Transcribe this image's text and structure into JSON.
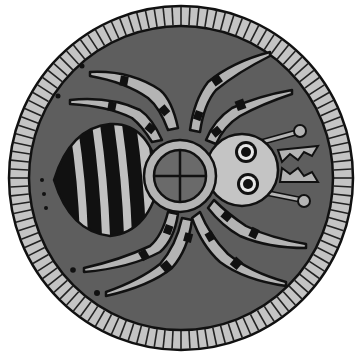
{
  "image": {
    "subject": "spider badge illustration",
    "colors": {
      "background": "#ffffff",
      "badge_fill": "#5e5e5e",
      "rim_light": "#c4c4c4",
      "part_light": "#b4b4b4",
      "outline": "#111111",
      "eye_white": "#e8e8e8"
    }
  }
}
